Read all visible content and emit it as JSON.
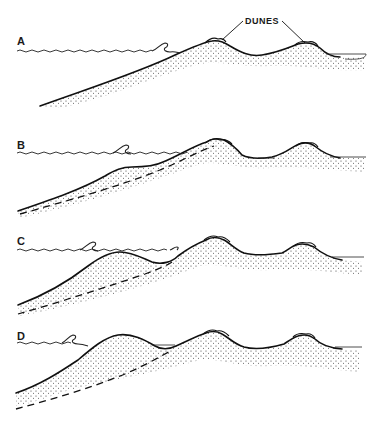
{
  "figure": {
    "callout": {
      "text": "DUNES",
      "targets": [
        "dune-1",
        "dune-2"
      ]
    },
    "panels": [
      {
        "id": "A",
        "label": "A",
        "description": "Original shoreface profile with two coastal dunes"
      },
      {
        "id": "B",
        "label": "B",
        "description": "Sand accumulates on the shoreface; original profile shown dashed"
      },
      {
        "id": "C",
        "label": "C",
        "description": "Offshore bar builds up; original profile dashed"
      },
      {
        "id": "D",
        "label": "D",
        "description": "Bar grows and migrates landward; original profile dashed"
      }
    ],
    "legend_elements": {
      "solid_line": "current sediment surface",
      "dashed_line": "former profile",
      "stipple": "sand",
      "wavy_line": "sea surface with breaking wave"
    },
    "colors": {
      "ink": "#111111",
      "background": "#ffffff"
    }
  }
}
